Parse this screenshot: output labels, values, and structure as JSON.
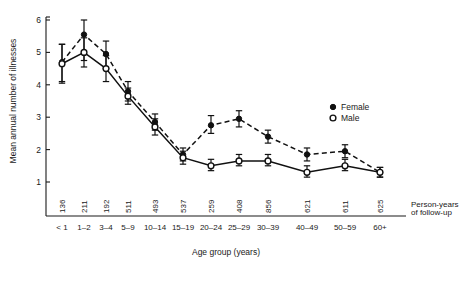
{
  "chart_data": {
    "type": "line",
    "title": "",
    "xlabel": "Age group (years)",
    "ylabel": "Mean annual number of illnesses",
    "ylim": [
      0.6,
      6.2
    ],
    "yticks": [
      1,
      2,
      3,
      4,
      5,
      6
    ],
    "grid": false,
    "legend_position": "right-middle",
    "categories": [
      "< 1",
      "1–2",
      "3–4",
      "5–9",
      "10–14",
      "15–19",
      "20–24",
      "25–29",
      "30–39",
      "40–49",
      "50–59",
      "60+"
    ],
    "secondary_axis_label": "Person-years of follow-up",
    "person_years": [
      136,
      211,
      192,
      511,
      493,
      537,
      259,
      408,
      856,
      621,
      611,
      625
    ],
    "series": [
      {
        "name": "Female",
        "marker": "filled-circle",
        "linestyle": "solid",
        "values": [
          4.7,
          5.55,
          4.95,
          3.8,
          2.85,
          1.85,
          2.75,
          2.95,
          2.4,
          1.85,
          1.95,
          1.3
        ],
        "err_low": [
          4.1,
          4.75,
          4.5,
          3.5,
          2.6,
          1.65,
          2.5,
          2.7,
          2.2,
          1.65,
          1.75,
          1.15
        ],
        "err_high": [
          5.25,
          6.0,
          5.35,
          4.1,
          3.1,
          2.05,
          3.05,
          3.2,
          2.6,
          2.05,
          2.15,
          1.45
        ]
      },
      {
        "name": "Male",
        "marker": "open-circle",
        "linestyle": "solid",
        "values": [
          4.65,
          5.0,
          4.5,
          3.65,
          2.7,
          1.75,
          1.5,
          1.65,
          1.65,
          1.3,
          1.5,
          1.3
        ],
        "err_low": [
          4.05,
          4.55,
          4.1,
          3.4,
          2.45,
          1.55,
          1.35,
          1.5,
          1.5,
          1.15,
          1.35,
          1.15
        ],
        "err_high": [
          5.25,
          5.45,
          4.9,
          3.9,
          2.95,
          1.95,
          1.7,
          1.85,
          1.85,
          1.5,
          1.7,
          1.45
        ]
      }
    ],
    "legend": [
      {
        "label": "Female",
        "marker": "filled-circle"
      },
      {
        "label": "Male",
        "marker": "open-circle"
      }
    ]
  }
}
